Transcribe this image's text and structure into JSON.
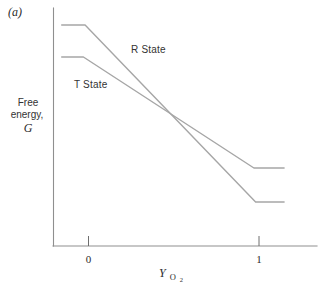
{
  "figure": {
    "panel_label": "(a)",
    "y_axis_label": {
      "line1": "Free",
      "line2": "energy,",
      "symbol": "G"
    },
    "x_axis_label": {
      "symbol": "Y",
      "subscript": "O",
      "subsubscript": "2"
    },
    "series_labels": {
      "r": "R State",
      "t": "T State"
    }
  },
  "colors": {
    "background": "#ffffff",
    "curve": "#a6a6a6",
    "axis": "#8f8f8f",
    "tick": "#6e6e6e",
    "text_dark": "#2b2b2b"
  },
  "chart_data": {
    "type": "line",
    "xlabel": "Y_O2",
    "ylabel": "Free energy, G",
    "x_tick_values": [
      0,
      1
    ],
    "x_tick_labels": [
      "0",
      "1"
    ],
    "xlim": [
      -0.22,
      1.35
    ],
    "ylim": [
      0,
      2.4
    ],
    "y_unit": "arbitrary (unlabeled axis)",
    "grid": false,
    "legend_position": "inline-annotations",
    "annotations": [
      {
        "text": "R State",
        "x": 0.38,
        "y": 1.95
      },
      {
        "text": "T State",
        "x": -0.07,
        "y": 1.6
      }
    ],
    "series": [
      {
        "name": "R State",
        "points": [
          [
            -0.16,
            2.21
          ],
          [
            -0.02,
            2.21
          ],
          [
            0.98,
            0.44
          ],
          [
            1.15,
            0.44
          ]
        ]
      },
      {
        "name": "T State",
        "points": [
          [
            -0.16,
            1.89
          ],
          [
            -0.03,
            1.89
          ],
          [
            0.97,
            0.78
          ],
          [
            1.15,
            0.78
          ]
        ]
      }
    ],
    "crossing_point": {
      "x": 0.48,
      "note": "R and T free-energy lines cross near mid-saturation"
    }
  }
}
